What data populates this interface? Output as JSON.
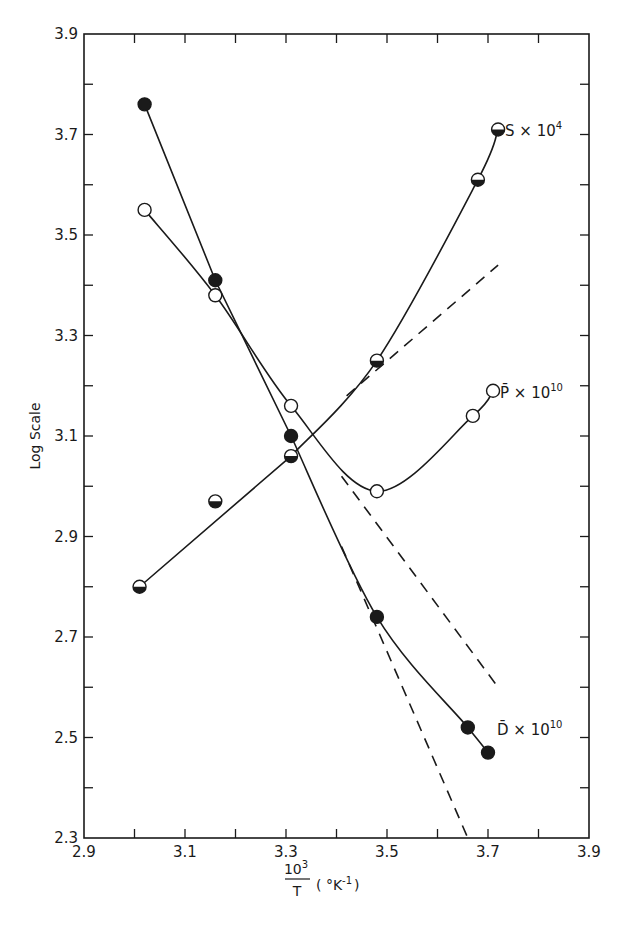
{
  "chart_data": {
    "type": "line",
    "title": "",
    "xlabel": "10^3/T (°K^-1)",
    "xlabel_parts": {
      "numerator": "10",
      "numerator_sup": "3",
      "denominator": "T",
      "units": "( °K",
      "units_sup": "-1",
      "units_close": ")"
    },
    "ylabel": "Log Scale",
    "xlim": [
      2.9,
      3.9
    ],
    "ylim": [
      2.3,
      3.9
    ],
    "x_ticks": [
      "2.9",
      "3.1",
      "3.3",
      "3.5",
      "3.7",
      "3.9"
    ],
    "y_ticks": [
      "2.3",
      "2.5",
      "2.7",
      "2.9",
      "3.1",
      "3.3",
      "3.5",
      "3.7",
      "3.9"
    ],
    "grid": false,
    "legend_position": "inline labels at right end of each curve",
    "series": [
      {
        "name": "S × 10^4",
        "label_main": "S × 10",
        "label_sup": "4",
        "marker": "half-filled circle (bottom half black)",
        "x": [
          3.01,
          3.16,
          3.31,
          3.48,
          3.68,
          3.72
        ],
        "y": [
          2.8,
          2.97,
          3.06,
          3.25,
          3.61,
          3.71
        ],
        "extrapolation": {
          "style": "dashed",
          "x": [
            3.42,
            3.72
          ],
          "y": [
            3.18,
            3.44
          ]
        }
      },
      {
        "name": "P̄ × 10^10",
        "label_main": "P̄ × 10",
        "label_sup": "10",
        "marker": "open circle",
        "x": [
          3.02,
          3.16,
          3.31,
          3.48,
          3.67,
          3.71
        ],
        "y": [
          3.55,
          3.38,
          3.16,
          2.99,
          3.14,
          3.19
        ],
        "extrapolation": {
          "style": "dashed",
          "x": [
            3.41,
            3.72
          ],
          "y": [
            3.02,
            2.6
          ]
        }
      },
      {
        "name": "D̄ × 10^10",
        "label_main": "D̄ × 10",
        "label_sup": "10",
        "marker": "filled circle",
        "x": [
          3.02,
          3.16,
          3.31,
          3.48,
          3.66,
          3.7
        ],
        "y": [
          3.76,
          3.41,
          3.1,
          2.74,
          2.52,
          2.47
        ],
        "extrapolation": {
          "style": "dashed",
          "x": [
            3.41,
            3.66
          ],
          "y": [
            2.88,
            2.3
          ]
        }
      }
    ]
  }
}
